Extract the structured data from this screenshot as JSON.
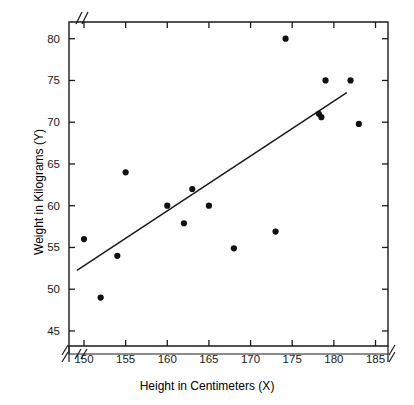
{
  "chart_data": {
    "type": "scatter",
    "title": "",
    "xlabel": "Height in Centimeters (X)",
    "ylabel": "Weight in Kilograms (Y)",
    "xlabel_text": "Height in Centimeters",
    "xlabel_var": "X",
    "ylabel_text": "Weight in Kilograms",
    "ylabel_var": "Y",
    "xlim": [
      148.2,
      186.5
    ],
    "ylim": [
      43.2,
      82.0
    ],
    "x_ticks": [
      150,
      155,
      160,
      165,
      170,
      175,
      180,
      185
    ],
    "y_ticks": [
      45,
      50,
      55,
      60,
      65,
      70,
      75,
      80
    ],
    "x_tick_labels": [
      "150",
      "155",
      "160",
      "165",
      "170",
      "175",
      "180",
      "185"
    ],
    "y_tick_labels": [
      "45",
      "50",
      "55",
      "60",
      "65",
      "70",
      "75",
      "80"
    ],
    "grid": false,
    "legend": null,
    "axis_break_x": true,
    "axis_break_y": true,
    "marker": "filled-circle",
    "marker_color": "#111111",
    "line_color": "#1a1a1a",
    "points": [
      {
        "x": 150.0,
        "y": 56.0
      },
      {
        "x": 152.0,
        "y": 49.0
      },
      {
        "x": 154.0,
        "y": 54.0
      },
      {
        "x": 155.0,
        "y": 64.0
      },
      {
        "x": 160.0,
        "y": 60.0
      },
      {
        "x": 162.0,
        "y": 57.9
      },
      {
        "x": 163.0,
        "y": 62.0
      },
      {
        "x": 165.0,
        "y": 60.0
      },
      {
        "x": 168.0,
        "y": 54.9
      },
      {
        "x": 173.0,
        "y": 56.9
      },
      {
        "x": 174.2,
        "y": 80.0
      },
      {
        "x": 178.2,
        "y": 71.0
      },
      {
        "x": 178.5,
        "y": 70.6
      },
      {
        "x": 179.0,
        "y": 75.0
      },
      {
        "x": 182.0,
        "y": 75.0
      },
      {
        "x": 183.0,
        "y": 69.8
      }
    ],
    "x": [
      150.0,
      152.0,
      154.0,
      155.0,
      160.0,
      162.0,
      163.0,
      165.0,
      168.0,
      173.0,
      174.2,
      178.2,
      178.5,
      179.0,
      182.0,
      183.0
    ],
    "y": [
      56.0,
      49.0,
      54.0,
      64.0,
      60.0,
      57.9,
      62.0,
      60.0,
      54.9,
      56.9,
      80.0,
      71.0,
      70.6,
      75.0,
      75.0,
      69.8
    ],
    "fit_line": {
      "name": "least-squares regression line",
      "x_start": 149.2,
      "y_start": 52.3,
      "x_end": 181.5,
      "y_end": 73.5
    }
  }
}
